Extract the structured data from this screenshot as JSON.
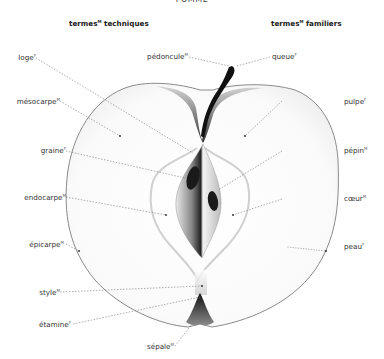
{
  "title": "POMME",
  "headers": {
    "left": {
      "text": "termes",
      "sup": "M",
      "rest": " techniques"
    },
    "right": {
      "text": "termes",
      "sup": "M",
      "rest": " familiers"
    }
  },
  "labels_left": [
    {
      "id": "loge",
      "text": "loge",
      "sup": "F"
    },
    {
      "id": "mesocarpe",
      "text": "mésocarpe",
      "sup": "M"
    },
    {
      "id": "graine",
      "text": "graine",
      "sup": "F"
    },
    {
      "id": "endocarpe",
      "text": "endocarpe",
      "sup": "M"
    },
    {
      "id": "epicarpe",
      "text": "épicarpe",
      "sup": "M"
    },
    {
      "id": "style",
      "text": "style",
      "sup": "M"
    },
    {
      "id": "etamine",
      "text": "étamine",
      "sup": "F"
    }
  ],
  "labels_center": [
    {
      "id": "pedoncule",
      "text": "pédoncule",
      "sup": "M"
    },
    {
      "id": "sepale",
      "text": "sépale",
      "sup": "M"
    }
  ],
  "labels_right": [
    {
      "id": "queue",
      "text": "queue",
      "sup": "F"
    },
    {
      "id": "pulpe",
      "text": "pulpe",
      "sup": "F"
    },
    {
      "id": "pepin",
      "text": "pépin",
      "sup": "M"
    },
    {
      "id": "coeur",
      "text": "cœur",
      "sup": "M"
    },
    {
      "id": "peau",
      "text": "peau",
      "sup": "F"
    }
  ],
  "colors": {
    "outline": "#8a8a8a",
    "leader": "#777777",
    "seed": "#1a1a1a",
    "stem": "#111111"
  }
}
